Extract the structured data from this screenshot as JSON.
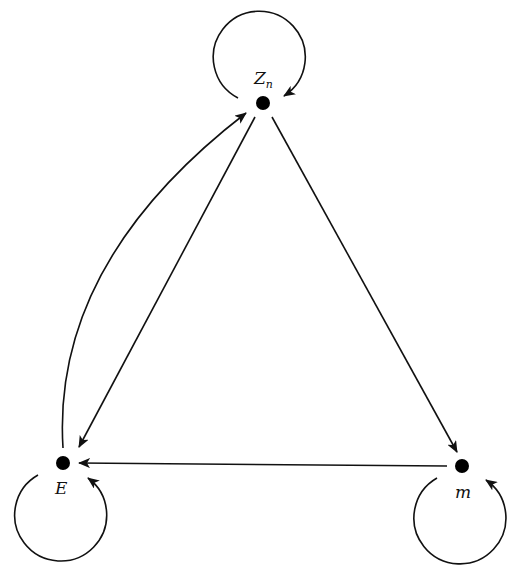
{
  "diagram": {
    "type": "directed-graph",
    "nodes": [
      {
        "id": "Zn",
        "label": "Z",
        "subscript": "n",
        "x": 263,
        "y": 103
      },
      {
        "id": "E",
        "label": "E",
        "subscript": "",
        "x": 63,
        "y": 463
      },
      {
        "id": "m",
        "label": "m",
        "subscript": "",
        "x": 462,
        "y": 466
      }
    ],
    "edges": [
      {
        "from": "Zn",
        "to": "Zn",
        "kind": "self-loop"
      },
      {
        "from": "E",
        "to": "E",
        "kind": "self-loop"
      },
      {
        "from": "m",
        "to": "m",
        "kind": "self-loop"
      },
      {
        "from": "Zn",
        "to": "E",
        "kind": "straight"
      },
      {
        "from": "E",
        "to": "Zn",
        "kind": "curved"
      },
      {
        "from": "Zn",
        "to": "m",
        "kind": "straight"
      },
      {
        "from": "m",
        "to": "E",
        "kind": "straight"
      }
    ],
    "colors": {
      "stroke": "#111111",
      "node": "#000000",
      "background": "#ffffff"
    }
  }
}
